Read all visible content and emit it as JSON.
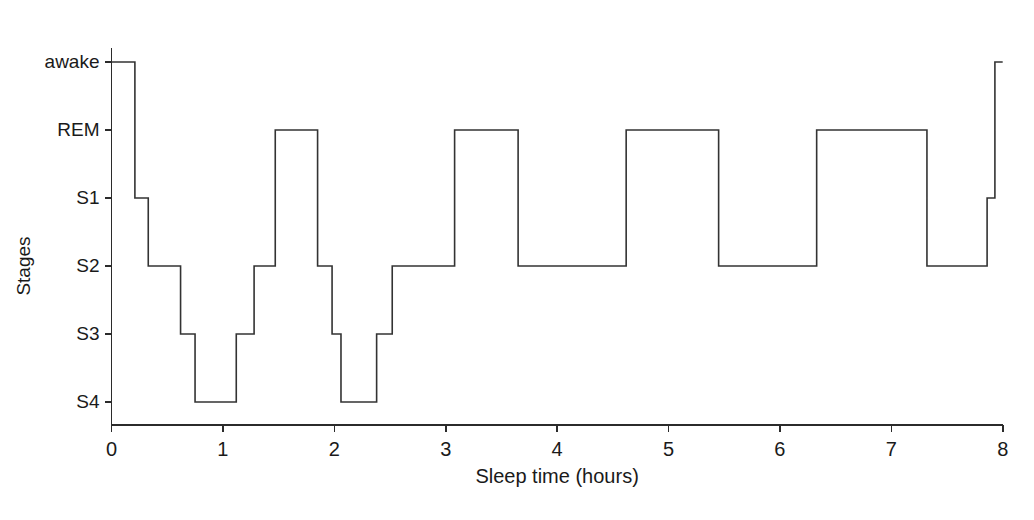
{
  "chart_data": {
    "type": "line",
    "title": "",
    "subtitle": "",
    "xlabel": "Sleep time (hours)",
    "ylabel": "Stages",
    "xlim": [
      0,
      8
    ],
    "ylim_categories": [
      "awake",
      "REM",
      "S1",
      "S2",
      "S3",
      "S4"
    ],
    "grid": false,
    "legend": null,
    "x_ticks": [
      "0",
      "1",
      "2",
      "3",
      "4",
      "5",
      "6",
      "7",
      "8"
    ],
    "x_tick_values": [
      0,
      1,
      2,
      3,
      4,
      5,
      6,
      7,
      8
    ],
    "y_ticks": [
      "awake",
      "REM",
      "S1",
      "S2",
      "S3",
      "S4"
    ],
    "stage_levels": {
      "awake": 0,
      "REM": 1,
      "S1": 2,
      "S2": 3,
      "S3": 4,
      "S4": 5
    },
    "line_color": "#333333",
    "axis_color": "#2b2b2b",
    "background_color": "#ffffff",
    "series": [
      {
        "name": "hypnogram",
        "step_type": "post",
        "segments": [
          {
            "start": 0.0,
            "end": 0.21,
            "stage": "awake"
          },
          {
            "start": 0.21,
            "end": 0.33,
            "stage": "S1"
          },
          {
            "start": 0.33,
            "end": 0.62,
            "stage": "S2"
          },
          {
            "start": 0.62,
            "end": 0.75,
            "stage": "S3"
          },
          {
            "start": 0.75,
            "end": 1.12,
            "stage": "S4"
          },
          {
            "start": 1.12,
            "end": 1.28,
            "stage": "S3"
          },
          {
            "start": 1.28,
            "end": 1.47,
            "stage": "S2"
          },
          {
            "start": 1.47,
            "end": 1.85,
            "stage": "REM"
          },
          {
            "start": 1.85,
            "end": 1.98,
            "stage": "S2"
          },
          {
            "start": 1.98,
            "end": 2.06,
            "stage": "S3"
          },
          {
            "start": 2.06,
            "end": 2.38,
            "stage": "S4"
          },
          {
            "start": 2.38,
            "end": 2.52,
            "stage": "S3"
          },
          {
            "start": 2.52,
            "end": 3.08,
            "stage": "S2"
          },
          {
            "start": 3.08,
            "end": 3.65,
            "stage": "REM"
          },
          {
            "start": 3.65,
            "end": 4.62,
            "stage": "S2"
          },
          {
            "start": 4.62,
            "end": 5.45,
            "stage": "REM"
          },
          {
            "start": 5.45,
            "end": 6.33,
            "stage": "S2"
          },
          {
            "start": 6.33,
            "end": 7.32,
            "stage": "REM"
          },
          {
            "start": 7.32,
            "end": 7.86,
            "stage": "S2"
          },
          {
            "start": 7.86,
            "end": 7.93,
            "stage": "S1"
          },
          {
            "start": 7.93,
            "end": 8.0,
            "stage": "awake"
          }
        ]
      }
    ]
  }
}
